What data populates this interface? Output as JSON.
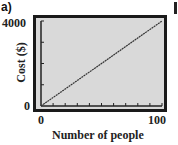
{
  "panel_label": "a)",
  "chart_data": {
    "type": "line",
    "title": "",
    "xlabel": "Number of people",
    "ylabel": "Cost ($)",
    "xlim": [
      0,
      100
    ],
    "ylim": [
      0,
      4000
    ],
    "x_tick_labels": [
      "0",
      "100"
    ],
    "y_tick_labels": [
      "0",
      "4000"
    ],
    "x_minor_ticks": 10,
    "y_minor_ticks": 4,
    "grid": false,
    "legend": null,
    "series": [
      {
        "name": "Cost",
        "x": [
          0,
          100
        ],
        "y": [
          0,
          4000
        ]
      }
    ]
  }
}
